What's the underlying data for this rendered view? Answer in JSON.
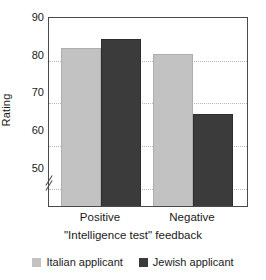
{
  "chart_data": {
    "type": "bar",
    "title": "",
    "xlabel": "\"Intelligence test\" feedback",
    "ylabel": "Rating",
    "categories": [
      "Positive",
      "Negative"
    ],
    "series": [
      {
        "name": "Italian applicant",
        "color": "#c2c2c2",
        "values": [
          83,
          81.5
        ]
      },
      {
        "name": "Jewish applicant",
        "color": "#3b3b3b",
        "values": [
          85,
          67.5
        ]
      }
    ],
    "ylim": [
      46,
      90
    ],
    "yticks": [
      50,
      60,
      70,
      80,
      90
    ],
    "ytick_labels": [
      "50",
      "60",
      "70",
      "80",
      "90"
    ],
    "grid": "horizontal-dotted",
    "axis_break": true,
    "legend_position": "below"
  },
  "axis": {
    "y_label": "Rating",
    "x_label": "\"Intelligence test\" feedback",
    "y_ticks": [
      "90",
      "80",
      "70",
      "60",
      "50"
    ],
    "x_categories": [
      "Positive",
      "Negative"
    ]
  },
  "legend": {
    "entries": [
      {
        "label": "Italian applicant",
        "color": "#c2c2c2"
      },
      {
        "label": "Jewish applicant",
        "color": "#3b3b3b"
      }
    ]
  }
}
